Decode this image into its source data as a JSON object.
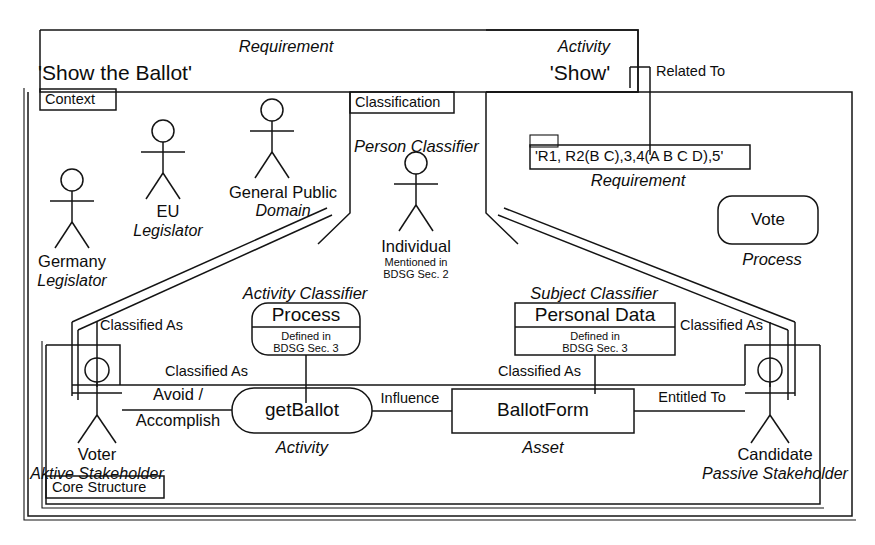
{
  "diagram": {
    "type": "uml-like-requirements-model"
  },
  "frames": {
    "requirement_frame": {
      "stereotype": "Requirement",
      "name": "'Show the Ballot'"
    },
    "activity_frame": {
      "stereotype": "Activity",
      "name": "'Show'"
    },
    "context_tab": "Context",
    "classification_tab": "Classification",
    "core_structure_tab": "Core Structure"
  },
  "actors": [
    {
      "name": "Germany",
      "stereotype": "Legislator"
    },
    {
      "name": "EU",
      "stereotype": "Legislator"
    },
    {
      "name": "General Public",
      "stereotype": "Domain"
    },
    {
      "name": "Individual",
      "stereotype": "Mentioned in",
      "stereotype2": "BDSG Sec. 2"
    },
    {
      "name": "Voter",
      "stereotype": "Aktive Stakeholder"
    },
    {
      "name": "Candidate",
      "stereotype": "Passive Stakeholder"
    }
  ],
  "classifier_labels": {
    "person": "Person Classifier",
    "activity": "Activity Classifier",
    "subject": "Subject Classifier"
  },
  "boxes": {
    "requirement_note": {
      "text": "'R1, R2(B C),3,4(A B C D),5'",
      "stereotype": "Requirement"
    },
    "vote": {
      "name": "Vote",
      "stereotype": "Process"
    },
    "process": {
      "name": "Process",
      "line1": "Defined in",
      "line2": "BDSG Sec. 3"
    },
    "personal_data": {
      "name": "Personal Data",
      "line1": "Defined in",
      "line2": "BDSG Sec. 3"
    },
    "get_ballot": {
      "name": "getBallot",
      "stereotype": "Activity"
    },
    "ballot_form": {
      "name": "BallotForm",
      "stereotype": "Asset"
    }
  },
  "edges": [
    {
      "label": "Related To"
    },
    {
      "label": "Classified As"
    },
    {
      "label": "Classified As"
    },
    {
      "label": "Classified As"
    },
    {
      "label": "Classified As"
    },
    {
      "label": "Avoid /"
    },
    {
      "label": "Accomplish"
    },
    {
      "label": "Influence"
    },
    {
      "label": "Entitled To"
    }
  ],
  "edge_labels": {
    "related_to": "Related To",
    "classified_as_1": "Classified As",
    "classified_as_2": "Classified As",
    "classified_as_3": "Classified As",
    "classified_as_4": "Classified As",
    "avoid": "Avoid /",
    "accomplish": "Accomplish",
    "influence": "Influence",
    "entitled_to": "Entitled To"
  },
  "colors": {
    "stroke": "#141414",
    "background": "#ffffff",
    "text": "#0d0d0d"
  }
}
